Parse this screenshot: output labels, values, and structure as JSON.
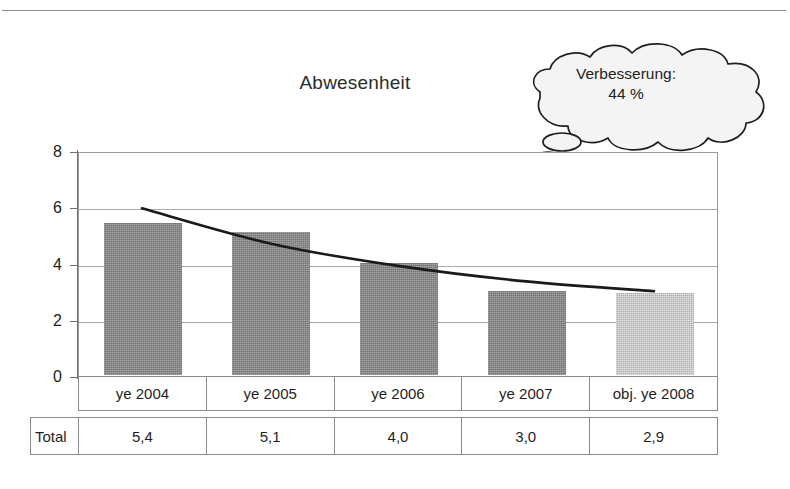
{
  "page": {
    "background_color": "#ffffff"
  },
  "title": "Abwesenheit",
  "callout": {
    "name": "thought-cloud",
    "line1": "Verbesserung:",
    "line2": "44 %"
  },
  "chart_data": {
    "type": "bar",
    "title": "Abwesenheit",
    "xlabel": "",
    "ylabel": "",
    "categories": [
      "ye 2004",
      "ye 2005",
      "ye 2006",
      "ye 2007",
      "obj. ye 2008"
    ],
    "values": [
      5.4,
      5.1,
      4.0,
      3.0,
      2.9
    ],
    "value_labels": [
      "5,4",
      "5,1",
      "4,0",
      "3,0",
      "2,9"
    ],
    "ylim": [
      0,
      8
    ],
    "yticks": [
      0,
      2,
      4,
      6,
      8
    ],
    "ytick_labels": [
      "0",
      "2",
      "4",
      "6",
      "8"
    ],
    "grid": true,
    "legend": false,
    "bar_colors": [
      "#808080",
      "#808080",
      "#808080",
      "#808080",
      "#c3c3c3"
    ],
    "series": [
      {
        "name": "Total",
        "values": [
          5.4,
          5.1,
          4.0,
          3.0,
          2.9
        ],
        "type": "bar"
      },
      {
        "name": "Trend",
        "type": "line",
        "color": "#1a1a1a",
        "points": [
          {
            "x": 0.0,
            "y": 6.0
          },
          {
            "x": 1.0,
            "y": 4.75
          },
          {
            "x": 2.0,
            "y": 3.95
          },
          {
            "x": 3.0,
            "y": 3.4
          },
          {
            "x": 4.0,
            "y": 3.05
          }
        ]
      }
    ],
    "annotations": [
      {
        "name": "thought-cloud",
        "text": "Verbesserung: 44 %"
      }
    ],
    "data_table": {
      "row_header": "Total",
      "columns": [
        "ye 2004",
        "ye 2005",
        "ye 2006",
        "ye 2007",
        "obj. ye 2008"
      ],
      "values": [
        "5,4",
        "5,1",
        "4,0",
        "3,0",
        "2,9"
      ]
    }
  },
  "axis": {
    "y_labels": [
      "8",
      "6",
      "4",
      "2",
      "0"
    ]
  },
  "colors": {
    "bar_dark": "#808080",
    "bar_light": "#c3c3c3",
    "grid": "#a9a9a9",
    "axis": "#6f6f6f",
    "border": "#8b8b8b",
    "text": "#1f1f1f",
    "trend_line": "#1a1a1a"
  }
}
